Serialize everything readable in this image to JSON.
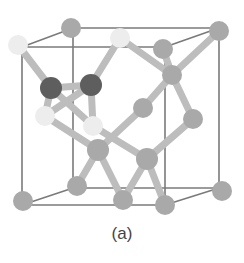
{
  "caption": "(a)",
  "colors": {
    "edge": "#7a7a7a",
    "bond": "#bdbdbd",
    "atom_gray": "#a9a9a9",
    "atom_white": "#ededed",
    "atom_dark": "#5e5e5e"
  },
  "cube_edges": [
    [
      22,
      47,
      165,
      47
    ],
    [
      165,
      47,
      165,
      205
    ],
    [
      165,
      205,
      22,
      205
    ],
    [
      22,
      205,
      22,
      47
    ],
    [
      73,
      28,
      219,
      28
    ],
    [
      219,
      28,
      219,
      188
    ],
    [
      219,
      188,
      73,
      188
    ],
    [
      73,
      188,
      73,
      28
    ],
    [
      22,
      47,
      73,
      28
    ],
    [
      165,
      47,
      219,
      28
    ],
    [
      165,
      205,
      219,
      188
    ],
    [
      22,
      205,
      73,
      188
    ]
  ],
  "bonds": [
    [
      18,
      45,
      51,
      88
    ],
    [
      120,
      38,
      91,
      85
    ],
    [
      51,
      88,
      91,
      85
    ],
    [
      51,
      88,
      93,
      126
    ],
    [
      91,
      85,
      45,
      116
    ],
    [
      51,
      88,
      45,
      116
    ],
    [
      91,
      85,
      93,
      126
    ],
    [
      120,
      38,
      172,
      75
    ],
    [
      163,
      49,
      172,
      75
    ],
    [
      219,
      31,
      172,
      75
    ],
    [
      172,
      75,
      143,
      108
    ],
    [
      172,
      75,
      193,
      119
    ],
    [
      143,
      108,
      98,
      150
    ],
    [
      193,
      119,
      147,
      159
    ],
    [
      45,
      116,
      98,
      150
    ],
    [
      93,
      126,
      147,
      159
    ],
    [
      98,
      150,
      77,
      186
    ],
    [
      98,
      150,
      123,
      200
    ],
    [
      147,
      159,
      123,
      200
    ],
    [
      147,
      159,
      165,
      205
    ]
  ],
  "atoms": [
    {
      "x": 71,
      "y": 28,
      "r": 10,
      "type": "gray"
    },
    {
      "x": 219,
      "y": 31,
      "r": 10,
      "type": "gray"
    },
    {
      "x": 18,
      "y": 45,
      "r": 10,
      "type": "white"
    },
    {
      "x": 120,
      "y": 38,
      "r": 10,
      "type": "white"
    },
    {
      "x": 163,
      "y": 49,
      "r": 10,
      "type": "gray"
    },
    {
      "x": 172,
      "y": 75,
      "r": 10,
      "type": "gray"
    },
    {
      "x": 51,
      "y": 88,
      "r": 11,
      "type": "dark"
    },
    {
      "x": 91,
      "y": 85,
      "r": 11,
      "type": "dark"
    },
    {
      "x": 45,
      "y": 116,
      "r": 10,
      "type": "white"
    },
    {
      "x": 93,
      "y": 126,
      "r": 10,
      "type": "white"
    },
    {
      "x": 143,
      "y": 108,
      "r": 10,
      "type": "gray"
    },
    {
      "x": 193,
      "y": 119,
      "r": 10,
      "type": "gray"
    },
    {
      "x": 98,
      "y": 150,
      "r": 11,
      "type": "gray"
    },
    {
      "x": 147,
      "y": 159,
      "r": 11,
      "type": "gray"
    },
    {
      "x": 77,
      "y": 186,
      "r": 10,
      "type": "gray"
    },
    {
      "x": 222,
      "y": 191,
      "r": 10,
      "type": "gray"
    },
    {
      "x": 23,
      "y": 201,
      "r": 10,
      "type": "gray"
    },
    {
      "x": 123,
      "y": 200,
      "r": 10,
      "type": "gray"
    },
    {
      "x": 165,
      "y": 205,
      "r": 10,
      "type": "gray"
    }
  ]
}
